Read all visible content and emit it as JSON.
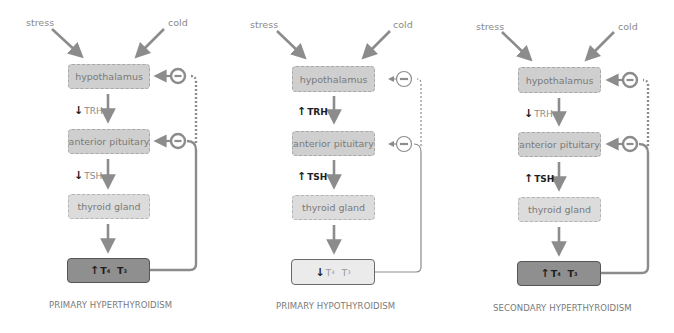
{
  "colors": {
    "arrow": "#8c8c8c",
    "box_fill": "#cfcfcf",
    "box_light_fill": "#dcdcdc",
    "elevated_fill": "#8f8f8f",
    "reduced_fill": "#ebebeb",
    "text_muted": "#8a8a8a",
    "text_dark": "#1e1e1e"
  },
  "panels": [
    {
      "id": "primary-hyperthyroidism",
      "inputs": {
        "stress": "stress",
        "cold": "cold"
      },
      "nodes": {
        "hypothalamus": "hypothalamus",
        "pituitary": "anterior pituitary",
        "thyroid": "thyroid gland"
      },
      "trh": {
        "arrow": "↓",
        "label": "TRH",
        "direction": "decreased"
      },
      "tsh": {
        "arrow": "↓",
        "label": "TSH",
        "direction": "decreased"
      },
      "output": {
        "arrow": "↑",
        "t4": "T",
        "t4_sub": "4",
        "t3": "T",
        "t3_sub": "3",
        "direction": "increased"
      },
      "caption": "PRIMARY HYPERTHYROIDISM"
    },
    {
      "id": "primary-hypothyroidism",
      "inputs": {
        "stress": "stress",
        "cold": "cold"
      },
      "nodes": {
        "hypothalamus": "hypothalamus",
        "pituitary": "anterior pituitary",
        "thyroid": "thyroid gland"
      },
      "trh": {
        "arrow": "↑",
        "label": "TRH",
        "direction": "increased"
      },
      "tsh": {
        "arrow": "↑",
        "label": "TSH",
        "direction": "increased"
      },
      "output": {
        "arrow": "↓",
        "t4": "T",
        "t4_sub": "4",
        "t3": "T",
        "t3_sub": "3",
        "direction": "decreased"
      },
      "caption": "PRIMARY HYPOTHYROIDISM"
    },
    {
      "id": "secondary-hyperthyroidism",
      "inputs": {
        "stress": "stress",
        "cold": "cold"
      },
      "nodes": {
        "hypothalamus": "hypothalamus",
        "pituitary": "anterior pituitary",
        "thyroid": "thyroid gland"
      },
      "trh": {
        "arrow": "↓",
        "label": "TRH",
        "direction": "decreased"
      },
      "tsh": {
        "arrow": "↑",
        "label": "TSH",
        "direction": "increased"
      },
      "output": {
        "arrow": "↑",
        "t4": "T",
        "t4_sub": "4",
        "t3": "T",
        "t3_sub": "3",
        "direction": "increased"
      },
      "caption": "SECONDARY HYPERTHYROIDISM"
    }
  ],
  "feedback_symbol": "−"
}
